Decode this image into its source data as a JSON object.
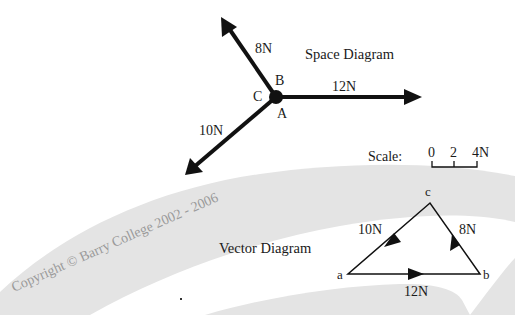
{
  "space_diagram": {
    "title": "Space Diagram",
    "point_labels": {
      "a": "A",
      "b": "B",
      "c": "C"
    },
    "forces": [
      {
        "name": "8N",
        "label": "8N"
      },
      {
        "name": "12N",
        "label": "12N"
      },
      {
        "name": "10N",
        "label": "10N"
      }
    ]
  },
  "scale": {
    "label": "Scale:",
    "ticks": [
      "0",
      "2",
      "4N"
    ]
  },
  "vector_diagram": {
    "title": "Vector Diagram",
    "vertices": {
      "a": "a",
      "b": "b",
      "c": "c"
    },
    "sides": [
      {
        "from": "a",
        "to": "b",
        "label": "12N"
      },
      {
        "from": "b",
        "to": "c",
        "label": "8N"
      },
      {
        "from": "c",
        "to": "a",
        "label": "10N"
      }
    ]
  },
  "watermark": {
    "text": "Copyright © Barry College 2002 - 2006"
  },
  "colors": {
    "ink": "#111111",
    "background": "#ffffff",
    "swoosh": "#e6e6e6",
    "watermark": "#9a9a9a"
  }
}
